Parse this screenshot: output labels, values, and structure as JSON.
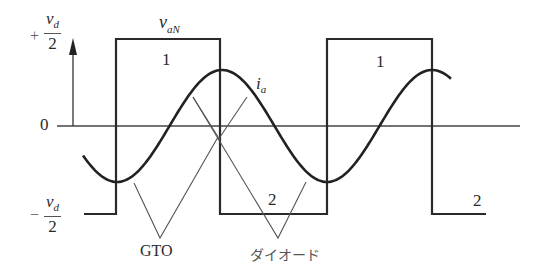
{
  "figure": {
    "type": "waveform-diagram",
    "y_axis": {
      "top_label": {
        "sign": "+",
        "numerator": "v",
        "numerator_sub": "d",
        "denominator": "2"
      },
      "zero_label": "0",
      "bottom_label": {
        "sign": "−",
        "numerator": "v",
        "numerator_sub": "d",
        "denominator": "2"
      }
    },
    "curves": {
      "voltage": {
        "name": "v",
        "sub": "aN",
        "shape": "square-wave"
      },
      "current": {
        "name": "i",
        "sub": "a",
        "shape": "sine"
      }
    },
    "segment_labels": {
      "upper_first": "1",
      "upper_second": "1",
      "lower_first": "2",
      "lower_second": "2"
    },
    "annotations": {
      "gto": "GTO",
      "diode": "ダイオード"
    },
    "colors": {
      "line": "#2a2a2a",
      "thin_line": "#555555",
      "background": "#ffffff"
    }
  }
}
